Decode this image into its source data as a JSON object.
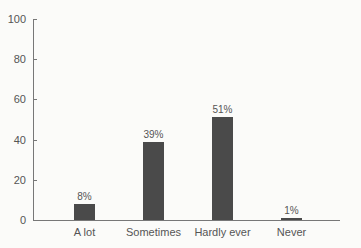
{
  "chart_data": {
    "type": "bar",
    "title": "",
    "xlabel": "",
    "ylabel": "",
    "ylim": [
      0,
      100
    ],
    "yticks": [
      "0",
      "20",
      "40",
      "60",
      "80",
      "100"
    ],
    "grid": false,
    "categories": [
      "A lot",
      "Sometimes",
      "Hardly ever",
      "Never"
    ],
    "values": [
      8,
      39,
      51,
      1
    ],
    "data_labels": [
      "8%",
      "39%",
      "51%",
      "1%"
    ],
    "bar_color": "#4a4a4a"
  }
}
